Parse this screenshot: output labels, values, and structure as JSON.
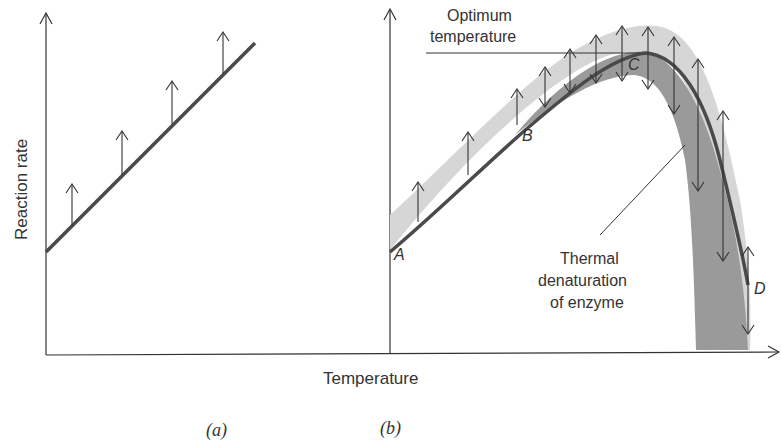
{
  "figure": {
    "y_axis_label": "Reaction rate",
    "x_axis_label": "Temperature",
    "panels": [
      {
        "id": "a",
        "caption": "(a)",
        "description": "Linear increase of reaction rate with temperature"
      },
      {
        "id": "b",
        "caption": "(b)",
        "description": "Enzyme-catalyzed reaction rate vs temperature"
      }
    ],
    "annotations": {
      "optimum": "Optimum temperature",
      "optimum_line1": "Optimum",
      "optimum_line2": "temperature",
      "denaturation_line1": "Thermal",
      "denaturation_line2": "denaturation",
      "denaturation_line3": "of enzyme",
      "point_a": "A",
      "point_b": "B",
      "point_c": "C",
      "point_d": "D"
    },
    "colors": {
      "curve": "#4a4a4a",
      "band_light": "#d6d6d6",
      "band_dark": "#9a9a9a",
      "axis": "#333333"
    }
  }
}
